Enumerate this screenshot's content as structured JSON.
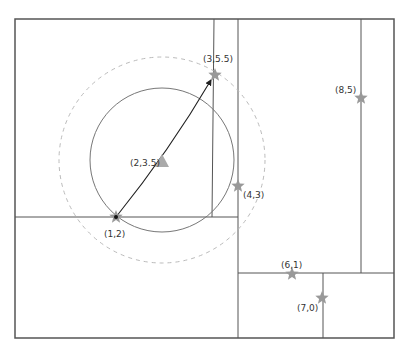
{
  "diagram": {
    "type": "kd-tree-nearest-neighbor",
    "colors": {
      "frame": "#555555",
      "partition": "#555555",
      "circle": "#777777",
      "dashed_circle": "#bbbbbb",
      "star": "#999999",
      "query": "#aaaaaa",
      "arrow": "#222222"
    },
    "points": [
      {
        "id": "p1",
        "label": "(1,2)",
        "x": 116,
        "y": 217,
        "lx": 104,
        "ly": 237
      },
      {
        "id": "p2",
        "label": "(3,5.5)",
        "x": 215,
        "y": 75,
        "lx": 203,
        "ly": 62
      },
      {
        "id": "p3",
        "label": "(4,3)",
        "x": 238,
        "y": 186,
        "lx": 243,
        "ly": 198
      },
      {
        "id": "p4",
        "label": "(6,1)",
        "x": 292,
        "y": 274,
        "lx": 281,
        "ly": 268
      },
      {
        "id": "p5",
        "label": "(7,0)",
        "x": 322,
        "y": 298,
        "lx": 297,
        "ly": 311
      },
      {
        "id": "p6",
        "label": "(8,5)",
        "x": 361,
        "y": 98,
        "lx": 335,
        "ly": 93
      }
    ],
    "query": {
      "label": "(2,3.5)",
      "x": 162,
      "y": 162,
      "lx": 130,
      "ly": 166
    },
    "circles": {
      "solid_radius": 72,
      "dashed_radius": 103
    }
  }
}
